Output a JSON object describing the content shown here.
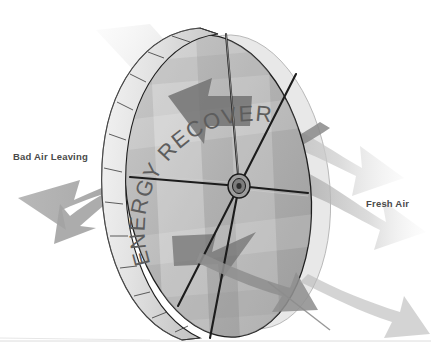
{
  "diagram": {
    "wheel_text": "ENERGY RECOVERY",
    "background_color": "#ffffff"
  },
  "labels": {
    "bad_air": "Bad Air Leaving",
    "fresh_air": "Fresh Air",
    "text_color": "#4a4a4a"
  },
  "airflows": [
    {
      "name": "bad-air-leaving",
      "direction": "left",
      "label": "Bad Air Leaving",
      "tone": "mid-gray",
      "color": "#9a9a9a"
    },
    {
      "name": "fresh-air-entering",
      "direction": "right",
      "label": "Fresh Air",
      "tone": "light-gray",
      "color": "#c9c9c9"
    },
    {
      "name": "exhaust-inbound-upper",
      "direction": "into-wheel",
      "label": "",
      "tone": "dark-gray",
      "color": "#7d7d7d"
    },
    {
      "name": "supply-inbound-lower",
      "direction": "into-wheel",
      "label": "",
      "tone": "dark-gray",
      "color": "#8a8a8a"
    }
  ],
  "wheel": {
    "rim_segments": 18,
    "spokes": 6,
    "hub_label": "hub",
    "rim_color": "#e3e3e3",
    "rim_edge_color": "#1a1a1a",
    "face_color": "#b5b5b5",
    "text_color": "#5a5a5a"
  },
  "ground": {
    "line_color": "#dcdcdc"
  }
}
